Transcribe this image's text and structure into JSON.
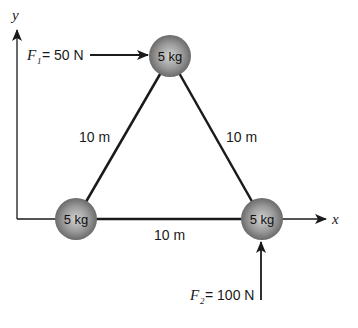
{
  "axes": {
    "x_label": "x",
    "y_label": "y"
  },
  "masses": [
    {
      "id": "top",
      "label": "5 kg"
    },
    {
      "id": "bottom-left",
      "label": "5 kg"
    },
    {
      "id": "bottom-right",
      "label": "5 kg"
    }
  ],
  "sides": {
    "left": "10 m",
    "right": "10 m",
    "bottom": "10 m"
  },
  "forces": {
    "f1": {
      "symbol": "F",
      "subscript": "1",
      "value": "= 50 N"
    },
    "f2": {
      "symbol": "F",
      "subscript": "2",
      "value": "= 100 N"
    }
  },
  "colors": {
    "line": "#1a1a1a",
    "sphere_light": "#cfcfcf",
    "sphere_dark": "#5a5a5a"
  }
}
